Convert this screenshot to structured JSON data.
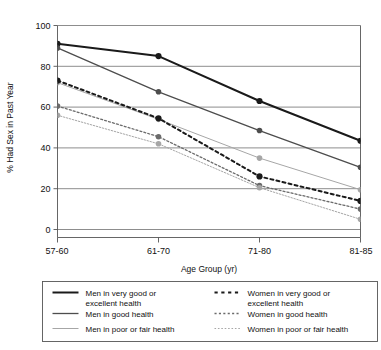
{
  "chart_data": {
    "type": "line",
    "title": "",
    "xlabel": "Age Group (yr)",
    "ylabel": "% Had Sex in Past Year",
    "categories": [
      "57-60",
      "61-70",
      "71-80",
      "81-85"
    ],
    "ylim": [
      0,
      100
    ],
    "yticks": [
      0,
      20,
      40,
      60,
      80,
      100
    ],
    "ytick_labels": [
      "0",
      "20",
      "40",
      "60",
      "80",
      "100"
    ],
    "grid": "horizontal",
    "legend_position": "bottom",
    "series": [
      {
        "name": "Men in very good or excellent health",
        "values": [
          91,
          85,
          63,
          43.5
        ],
        "style": "solid",
        "color": "#1a1a1a",
        "width": 2.0,
        "marker": "circle"
      },
      {
        "name": "Men in good health",
        "values": [
          89,
          67.5,
          48.5,
          30.5
        ],
        "style": "solid",
        "color": "#4d4d4d",
        "width": 1.3,
        "marker": "circle"
      },
      {
        "name": "Men in poor or fair health",
        "values": [
          72,
          54,
          35,
          19.5
        ],
        "style": "solid",
        "color": "#a6a6a6",
        "width": 1.0,
        "marker": "circle"
      },
      {
        "name": "Women in very good or excellent health",
        "values": [
          73,
          54.5,
          26,
          14
        ],
        "style": "dashed",
        "color": "#1a1a1a",
        "width": 2.0,
        "marker": "circle"
      },
      {
        "name": "Women in good health",
        "values": [
          60.5,
          45.5,
          21.5,
          10
        ],
        "style": "dashed",
        "color": "#6b6b6b",
        "width": 1.3,
        "marker": "circle"
      },
      {
        "name": "Women in poor or fair health",
        "values": [
          56,
          42,
          20.5,
          5
        ],
        "style": "dashed",
        "color": "#a6a6a6",
        "width": 1.0,
        "marker": "circle"
      }
    ]
  },
  "legend": {
    "items": [
      {
        "label_line1": "Men in very good or",
        "label_line2": "excellent health",
        "series": 0
      },
      {
        "label_line1": "Men in good health",
        "label_line2": "",
        "series": 1
      },
      {
        "label_line1": "Men in poor or fair health",
        "label_line2": "",
        "series": 2
      },
      {
        "label_line1": "Women in very good or",
        "label_line2": "excellent health",
        "series": 3
      },
      {
        "label_line1": "Women in good health",
        "label_line2": "",
        "series": 4
      },
      {
        "label_line1": "Women in poor or fair health",
        "label_line2": "",
        "series": 5
      }
    ]
  },
  "style": {
    "grid_color": "#808080",
    "axis_color": "#555555",
    "legend_border": "#555555",
    "background": "#ffffff"
  }
}
